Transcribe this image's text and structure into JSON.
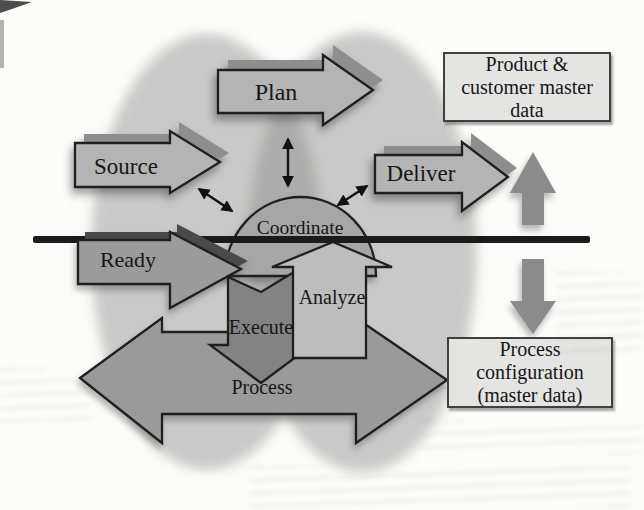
{
  "figure": {
    "labels": {
      "plan": "Plan",
      "source": "Source",
      "deliver": "Deliver",
      "coordinate": "Coordinate",
      "ready": "Ready",
      "execute": "Execute",
      "analyze": "Analyze",
      "process": "Process"
    },
    "boxes": {
      "product_master": {
        "lines": [
          "Product &",
          "customer master",
          "data"
        ]
      },
      "process_config": {
        "lines": [
          "Process",
          "configuration",
          "(master data)"
        ]
      }
    },
    "colors": {
      "page_background": "#fcfcfb",
      "ellipse_tint": "rgba(130,130,130,0.42)",
      "arrow_light": "#b4b4b4",
      "arrow_extrude": "#8e8e8e",
      "dome_fill": "#a6a6a6",
      "ready_fill": "#9b9b9b",
      "ready_extrude": "#4a4a4a",
      "process_fill": "#9a9a9a",
      "execute_fill": "#838383",
      "analyze_fill": "#bdbdbd",
      "side_arrow_fill": "#8b8b8b",
      "divider_line": "#1b1b1b",
      "shape_outline": "#1f1f1f",
      "connector": "#111111",
      "box_fill": "#e4e4e3",
      "box_border": "#3f3f3f",
      "text": "#161616"
    }
  }
}
